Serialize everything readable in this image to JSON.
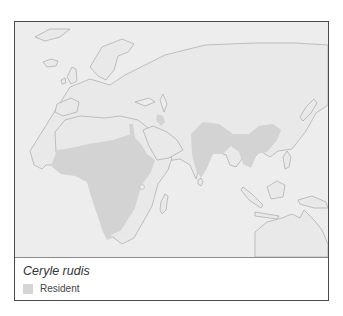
{
  "map": {
    "title": "Ceryle rudis range map",
    "colors": {
      "ocean": "#ededed",
      "land": "#e9e9e9",
      "coastline": "#a9a9a9",
      "range_resident": "#d4d4d4",
      "frame": "#4a4a4a"
    },
    "regions_shown": [
      "Europe",
      "Africa",
      "Middle East",
      "South Asia",
      "Southeast Asia",
      "East Asia",
      "Australia"
    ],
    "range_regions": [
      "Sub-Saharan Africa",
      "Nile valley / Egypt",
      "Levant",
      "Iraq/Iran patch",
      "Indian subcontinent",
      "Southeast Asia",
      "Southern China"
    ]
  },
  "legend": {
    "species": "Ceryle rudis",
    "items": [
      {
        "label": "Resident",
        "color": "#d6d6d6"
      }
    ]
  }
}
